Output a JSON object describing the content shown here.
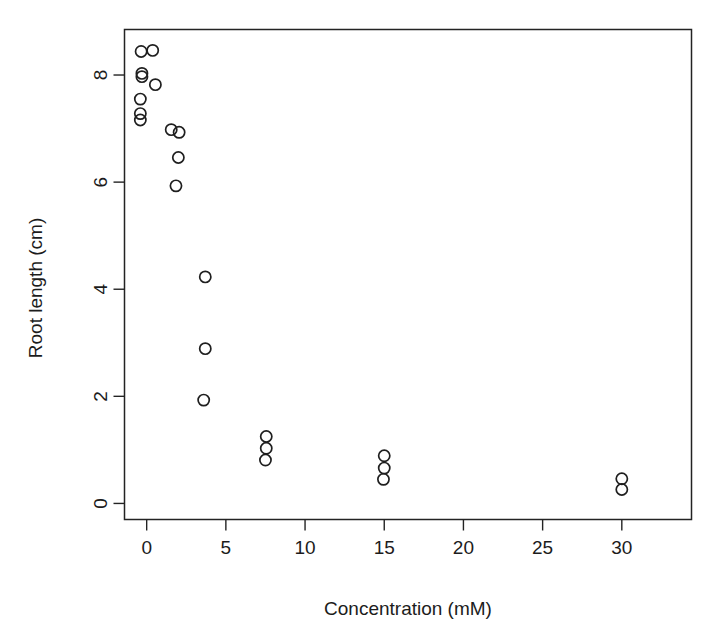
{
  "chart_data": {
    "type": "scatter",
    "title": "",
    "xlabel": "Concentration (mM)",
    "ylabel": "Root length (cm)",
    "xlim": [
      -1.4,
      34.4
    ],
    "ylim": [
      -0.3,
      8.85
    ],
    "xticks": [
      0,
      5,
      10,
      15,
      20,
      25,
      30
    ],
    "xticklabels": [
      "0",
      "5",
      "10",
      "15",
      "20",
      "25",
      "30"
    ],
    "yticks": [
      0,
      2,
      4,
      6,
      8
    ],
    "yticklabels": [
      "0",
      "2",
      "4",
      "6",
      "8"
    ],
    "grid": false,
    "legend": false,
    "marker": "open-circle",
    "marker_color": "#1f1f1f",
    "point_count": 23,
    "points": [
      {
        "x": -0.35,
        "y": 8.44
      },
      {
        "x": 0.38,
        "y": 8.46
      },
      {
        "x": -0.3,
        "y": 8.03
      },
      {
        "x": -0.3,
        "y": 7.97
      },
      {
        "x": 0.55,
        "y": 7.82
      },
      {
        "x": -0.4,
        "y": 7.55
      },
      {
        "x": -0.4,
        "y": 7.28
      },
      {
        "x": -0.4,
        "y": 7.16
      },
      {
        "x": 1.55,
        "y": 6.98
      },
      {
        "x": 2.05,
        "y": 6.93
      },
      {
        "x": 2.0,
        "y": 6.46
      },
      {
        "x": 1.85,
        "y": 5.93
      },
      {
        "x": 3.7,
        "y": 4.23
      },
      {
        "x": 3.7,
        "y": 2.89
      },
      {
        "x": 3.6,
        "y": 1.93
      },
      {
        "x": 7.55,
        "y": 1.25
      },
      {
        "x": 7.55,
        "y": 1.03
      },
      {
        "x": 7.5,
        "y": 0.81
      },
      {
        "x": 15.0,
        "y": 0.89
      },
      {
        "x": 15.0,
        "y": 0.66
      },
      {
        "x": 14.95,
        "y": 0.45
      },
      {
        "x": 30.0,
        "y": 0.46
      },
      {
        "x": 30.0,
        "y": 0.26
      }
    ]
  },
  "figure": {
    "background_color": "#ffffff",
    "axis_color": "#232323"
  }
}
